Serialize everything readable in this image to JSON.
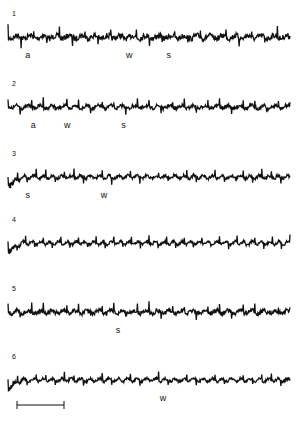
{
  "chart_data": {
    "type": "line",
    "title": "",
    "xlabel": "",
    "ylabel": "",
    "grid": false,
    "legend": "none",
    "color": "#111111",
    "series": [
      {
        "name": "1",
        "annotations": [
          {
            "text": "a",
            "t": 0.07
          },
          {
            "text": "w",
            "t": 0.43
          },
          {
            "text": "s",
            "t": 0.57
          }
        ],
        "spike_rate": 22,
        "noise": 0.9,
        "onset_dip": false
      },
      {
        "name": "2",
        "annotations": [
          {
            "text": "a",
            "t": 0.09
          },
          {
            "text": "w",
            "t": 0.21
          },
          {
            "text": "s",
            "t": 0.41
          }
        ],
        "spike_rate": 24,
        "noise": 0.6,
        "onset_dip": false
      },
      {
        "name": "3",
        "annotations": [
          {
            "text": "s",
            "t": 0.07
          },
          {
            "text": "w",
            "t": 0.34
          }
        ],
        "spike_rate": 30,
        "noise": 0.5,
        "onset_dip": true
      },
      {
        "name": "4",
        "annotations": [],
        "spike_rate": 32,
        "noise": 0.45,
        "onset_dip": true
      },
      {
        "name": "5",
        "annotations": [
          {
            "text": "s",
            "t": 0.39
          }
        ],
        "spike_rate": 24,
        "noise": 0.7,
        "onset_dip": false
      },
      {
        "name": "6",
        "annotations": [
          {
            "text": "w",
            "t": 0.55
          }
        ],
        "spike_rate": 30,
        "noise": 0.45,
        "onset_dip": true
      }
    ],
    "scale_bar": {
      "label": ""
    }
  }
}
